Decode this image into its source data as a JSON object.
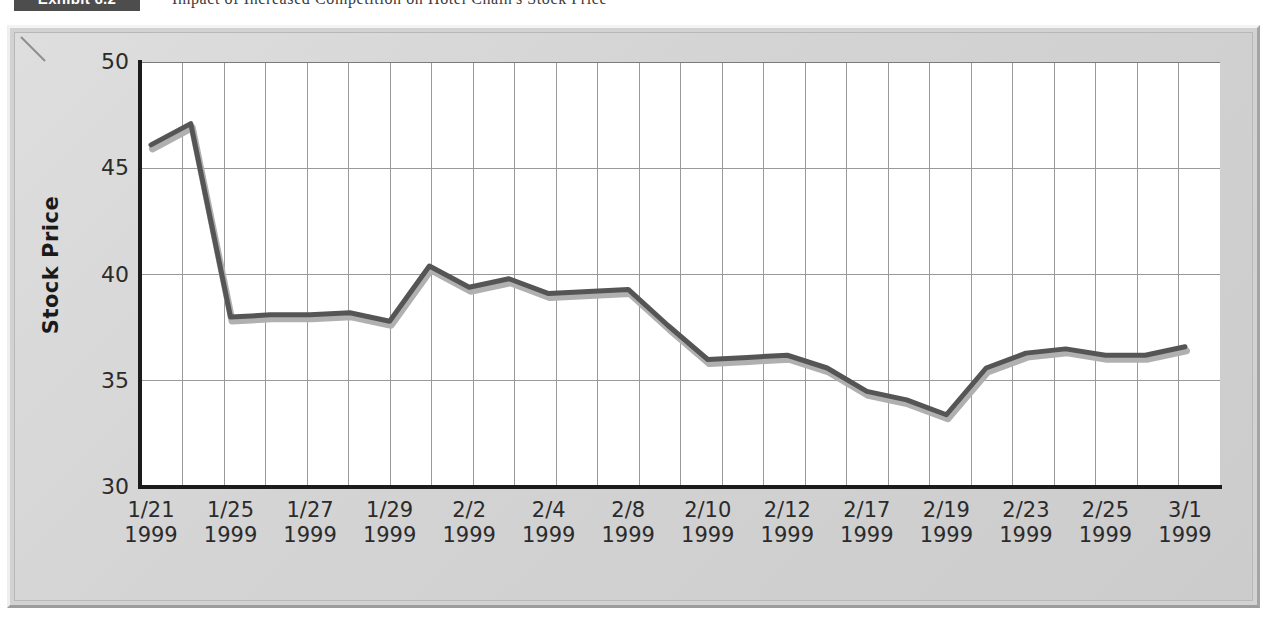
{
  "exhibit": {
    "badge_label": "Exhibit 6.2",
    "title": "Impact of Increased Competition on Hotel Chain's Stock Price"
  },
  "colors": {
    "line": "#555555",
    "line_shadow": "#b0b0b0",
    "plot_background": "#ffffff",
    "figure_background": "#d6d6d6",
    "grid": "#9a9a9a",
    "axis": "#1b1b1b",
    "badge_background": "#4d4d4d",
    "text": "#2b2b2b"
  },
  "chart_data": {
    "type": "line",
    "title": "Impact of Increased Competition on Hotel Chain's Stock Price",
    "xlabel": "",
    "ylabel": "Stock Price",
    "ylim": [
      30,
      50
    ],
    "y_ticks": [
      30,
      35,
      40,
      45,
      50
    ],
    "y_tick_labels": [
      "30",
      "35",
      "40",
      "45",
      "50"
    ],
    "grid": true,
    "legend": "none",
    "x_tick_labels": [
      {
        "date": "1/21",
        "year": "1999"
      },
      {
        "date": "1/25",
        "year": "1999"
      },
      {
        "date": "1/27",
        "year": "1999"
      },
      {
        "date": "1/29",
        "year": "1999"
      },
      {
        "date": "2/2",
        "year": "1999"
      },
      {
        "date": "2/4",
        "year": "1999"
      },
      {
        "date": "2/8",
        "year": "1999"
      },
      {
        "date": "2/10",
        "year": "1999"
      },
      {
        "date": "2/12",
        "year": "1999"
      },
      {
        "date": "2/17",
        "year": "1999"
      },
      {
        "date": "2/19",
        "year": "1999"
      },
      {
        "date": "2/23",
        "year": "1999"
      },
      {
        "date": "2/25",
        "year": "1999"
      },
      {
        "date": "3/1",
        "year": "1999"
      }
    ],
    "x": [
      "1/21/1999",
      "1/22/1999",
      "1/25/1999",
      "1/26/1999",
      "1/27/1999",
      "1/28/1999",
      "1/29/1999",
      "2/1/1999",
      "2/2/1999",
      "2/3/1999",
      "2/4/1999",
      "2/5/1999",
      "2/8/1999",
      "2/9/1999",
      "2/10/1999",
      "2/11/1999",
      "2/12/1999",
      "2/16/1999",
      "2/17/1999",
      "2/18/1999",
      "2/19/1999",
      "2/22/1999",
      "2/23/1999",
      "2/24/1999",
      "2/25/1999",
      "2/26/1999",
      "3/1/1999"
    ],
    "series": [
      {
        "name": "Stock Price",
        "values": [
          46.1,
          47.1,
          38.0,
          38.1,
          38.1,
          38.2,
          37.8,
          40.4,
          39.4,
          39.8,
          39.1,
          39.2,
          39.3,
          37.6,
          36.0,
          36.1,
          36.2,
          35.6,
          34.5,
          34.1,
          33.4,
          35.6,
          36.3,
          36.5,
          36.2,
          36.2,
          36.6
        ]
      }
    ]
  }
}
